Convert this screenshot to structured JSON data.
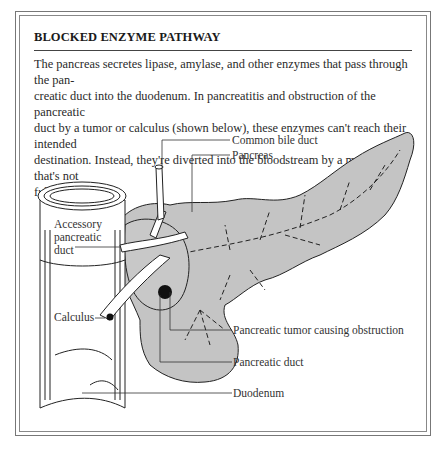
{
  "panel": {
    "title": "BLOCKED ENZYME PATHWAY",
    "description": "The pancreas secretes lipase, amylase, and other enzymes that pass through the pan-creatic duct into the duodenum. In pancreatitis and obstruction of the pancreatic duct by a tumor or calculus (shown below), these enzymes can't reach their intended destination. Instead, they're diverted into the bloodstream by a mechanism that's not fully understood.",
    "description_lines": [
      "The pancreas secretes lipase, amylase, and other enzymes that pass through the pan-",
      "creatic duct into the duodenum. In pancreatitis and obstruction of the pancreatic",
      "duct by a tumor or calculus (shown below), these enzymes can't reach their intended",
      "destination. Instead, they're diverted into the bloodstream by a mechanism that's not",
      "fully understood."
    ]
  },
  "illustration": {
    "labels": {
      "common_bile_duct": "Common bile duct",
      "pancreas": "Pancreas",
      "accessory_duct_line1": "Accessory",
      "accessory_duct_line2": "pancreatic",
      "accessory_duct_line3": "duct",
      "calculus": "Calculus",
      "tumor": "Pancreatic tumor causing obstruction",
      "pancreatic_duct": "Pancreatic duct",
      "duodenum": "Duodenum"
    },
    "colors": {
      "pancreas_fill": "#c4c4c4",
      "outline": "#222222",
      "frame": "#777777"
    }
  }
}
